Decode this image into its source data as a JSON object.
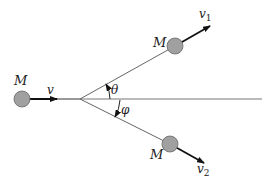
{
  "diagram": {
    "labels": {
      "mass_initial": "M",
      "velocity_initial": "v",
      "mass_upper": "M",
      "velocity_upper": "v",
      "velocity_upper_sub": "1",
      "mass_lower": "M",
      "velocity_lower": "v",
      "velocity_lower_sub": "2",
      "angle_upper": "θ",
      "angle_lower": "φ"
    },
    "colors": {
      "ball_fill": "#a0a0a0",
      "ball_stroke": "#555555",
      "line": "#555555"
    }
  }
}
